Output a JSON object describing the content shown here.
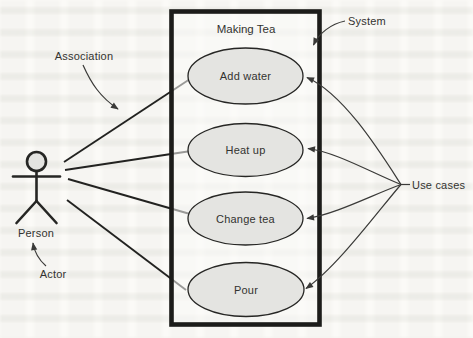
{
  "diagram": {
    "system": {
      "title": "Making Tea",
      "label": "System"
    },
    "actor": {
      "name": "Person",
      "label": "Actor"
    },
    "use_cases": [
      {
        "name": "Add water"
      },
      {
        "name": "Heat up"
      },
      {
        "name": "Change tea"
      },
      {
        "name": "Pour"
      }
    ],
    "annotations": {
      "association": "Association",
      "use_cases": "Use cases"
    },
    "colors": {
      "ink": "#262624",
      "ellipse_fill": "#e4e4e1",
      "background": "#fbfaf7"
    }
  }
}
